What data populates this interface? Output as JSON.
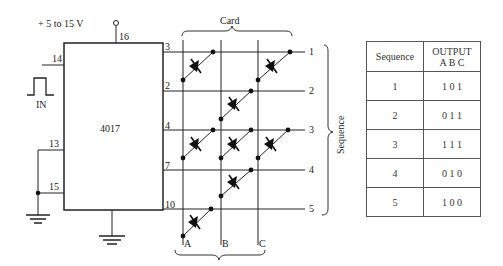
{
  "circuit": {
    "supply_label": "+ 5 to 15 V",
    "ic_label": "4017",
    "input_label": "IN",
    "pins": {
      "vdd": "16",
      "clk": "14",
      "en": "13",
      "rst": "15",
      "q0": "3",
      "q1": "2",
      "q2": "4",
      "q3": "7",
      "q4": "10"
    },
    "card_label": "Card",
    "row_labels": [
      "1",
      "2",
      "3",
      "4",
      "5"
    ],
    "column_labels": [
      "A",
      "B",
      "C"
    ],
    "sequence_label": "Sequence"
  },
  "table": {
    "headers": [
      "Sequence",
      "OUTPUT",
      "A B C"
    ],
    "rows": [
      {
        "seq": "1",
        "out": "1 0 1"
      },
      {
        "seq": "2",
        "out": "0 1 1"
      },
      {
        "seq": "3",
        "out": "1 1 1"
      },
      {
        "seq": "4",
        "out": "0 1 0"
      },
      {
        "seq": "5",
        "out": "1 0 0"
      }
    ]
  }
}
